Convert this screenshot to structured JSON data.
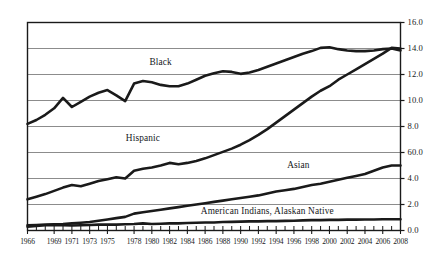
{
  "chart_data": {
    "type": "line",
    "title": "",
    "xlabel": "",
    "ylabel": "",
    "xlim": [
      1966,
      2008
    ],
    "ylim": [
      0.0,
      16.0
    ],
    "grid": true,
    "grid_orientation": "horizontal",
    "legend_position": "inline-labels",
    "y_axis_side": "right",
    "line_color": "#1a1a1a",
    "grid_color": "#8c8c8c",
    "frame_color": "#1a1a1a",
    "background_color": "#ffffff",
    "y_ticks": [
      "16.0",
      "14.0",
      "12.0",
      "10.0",
      "8.0",
      "60.0",
      "4.0",
      "2.0",
      "0.0"
    ],
    "y_tick_values": [
      16.0,
      14.0,
      12.0,
      10.0,
      8.0,
      6.0,
      4.0,
      2.0,
      0.0
    ],
    "x_ticks": [
      "1966",
      "1969",
      "1971",
      "1973",
      "1975",
      "1978",
      "1980",
      "1982",
      "1984",
      "1986",
      "1988",
      "1990",
      "1992",
      "1994",
      "1996",
      "1998",
      "2000",
      "2002",
      "2004",
      "2006",
      "2008"
    ],
    "x_tick_values": [
      1966,
      1969,
      1971,
      1973,
      1975,
      1978,
      1980,
      1982,
      1984,
      1986,
      1988,
      1990,
      1992,
      1994,
      1996,
      1998,
      2000,
      2002,
      2004,
      2006,
      2008
    ],
    "x_minor_ticks_annual": true,
    "series": [
      {
        "name": "Black",
        "label": "Black",
        "label_x": 1981.0,
        "label_y": 12.85,
        "x": [
          1966,
          1967,
          1968,
          1969,
          1970,
          1971,
          1972,
          1973,
          1974,
          1975,
          1976,
          1977,
          1978,
          1979,
          1980,
          1981,
          1982,
          1983,
          1984,
          1985,
          1986,
          1987,
          1988,
          1989,
          1990,
          1991,
          1992,
          1993,
          1994,
          1995,
          1996,
          1997,
          1998,
          1999,
          2000,
          2001,
          2002,
          2003,
          2004,
          2005,
          2006,
          2007,
          2008
        ],
        "values": [
          8.2,
          8.5,
          8.9,
          9.4,
          10.2,
          9.5,
          9.9,
          10.3,
          10.6,
          10.8,
          10.4,
          9.95,
          11.3,
          11.5,
          11.4,
          11.2,
          11.1,
          11.1,
          11.3,
          11.6,
          11.9,
          12.1,
          12.25,
          12.2,
          12.05,
          12.15,
          12.35,
          12.6,
          12.85,
          13.1,
          13.35,
          13.6,
          13.8,
          14.05,
          14.1,
          13.95,
          13.85,
          13.8,
          13.8,
          13.85,
          13.95,
          14.0,
          13.85
        ]
      },
      {
        "name": "Hispanic",
        "label": "Hispanic",
        "label_x": 1979.0,
        "label_y": 7.05,
        "x": [
          1966,
          1967,
          1968,
          1969,
          1970,
          1971,
          1972,
          1973,
          1974,
          1975,
          1976,
          1977,
          1978,
          1979,
          1980,
          1981,
          1982,
          1983,
          1984,
          1985,
          1986,
          1987,
          1988,
          1989,
          1990,
          1991,
          1992,
          1993,
          1994,
          1995,
          1996,
          1997,
          1998,
          1999,
          2000,
          2001,
          2002,
          2003,
          2004,
          2005,
          2006,
          2007,
          2008
        ],
        "values": [
          2.4,
          2.6,
          2.8,
          3.05,
          3.3,
          3.5,
          3.4,
          3.6,
          3.8,
          3.95,
          4.1,
          4.0,
          4.6,
          4.75,
          4.85,
          5.0,
          5.2,
          5.1,
          5.2,
          5.35,
          5.55,
          5.8,
          6.05,
          6.3,
          6.6,
          6.95,
          7.35,
          7.8,
          8.3,
          8.8,
          9.3,
          9.8,
          10.3,
          10.75,
          11.1,
          11.6,
          12.0,
          12.4,
          12.8,
          13.2,
          13.6,
          14.05,
          14.0
        ]
      },
      {
        "name": "Asian",
        "label": "Asian",
        "label_x": 1996.5,
        "label_y": 4.95,
        "x": [
          1966,
          1967,
          1968,
          1969,
          1970,
          1971,
          1972,
          1973,
          1974,
          1975,
          1976,
          1977,
          1978,
          1979,
          1980,
          1981,
          1982,
          1983,
          1984,
          1985,
          1986,
          1987,
          1988,
          1989,
          1990,
          1991,
          1992,
          1993,
          1994,
          1995,
          1996,
          1997,
          1998,
          1999,
          2000,
          2001,
          2002,
          2003,
          2004,
          2005,
          2006,
          2007,
          2008
        ],
        "values": [
          0.4,
          0.42,
          0.45,
          0.48,
          0.5,
          0.55,
          0.6,
          0.65,
          0.75,
          0.85,
          0.95,
          1.05,
          1.3,
          1.4,
          1.5,
          1.6,
          1.7,
          1.8,
          1.9,
          2.0,
          2.1,
          2.2,
          2.3,
          2.4,
          2.5,
          2.6,
          2.7,
          2.85,
          3.0,
          3.1,
          3.2,
          3.35,
          3.5,
          3.6,
          3.75,
          3.9,
          4.05,
          4.2,
          4.35,
          4.6,
          4.85,
          5.0,
          5.0
        ]
      },
      {
        "name": "American Indians, Alaskan Native",
        "label": "American Indians, Alaskan Native",
        "label_x": 1993.0,
        "label_y": 1.45,
        "x": [
          1966,
          1967,
          1968,
          1969,
          1970,
          1971,
          1972,
          1973,
          1974,
          1975,
          1976,
          1977,
          1978,
          1979,
          1980,
          1981,
          1982,
          1983,
          1984,
          1985,
          1986,
          1987,
          1988,
          1989,
          1990,
          1991,
          1992,
          1993,
          1994,
          1995,
          1996,
          1997,
          1998,
          1999,
          2000,
          2001,
          2002,
          2003,
          2004,
          2005,
          2006,
          2007,
          2008
        ],
        "values": [
          0.3,
          0.35,
          0.4,
          0.42,
          0.4,
          0.38,
          0.4,
          0.42,
          0.45,
          0.45,
          0.45,
          0.48,
          0.5,
          0.55,
          0.5,
          0.52,
          0.55,
          0.55,
          0.58,
          0.6,
          0.62,
          0.62,
          0.65,
          0.66,
          0.68,
          0.7,
          0.7,
          0.72,
          0.72,
          0.74,
          0.75,
          0.78,
          0.8,
          0.8,
          0.82,
          0.82,
          0.84,
          0.84,
          0.85,
          0.85,
          0.86,
          0.86,
          0.86
        ]
      }
    ]
  }
}
